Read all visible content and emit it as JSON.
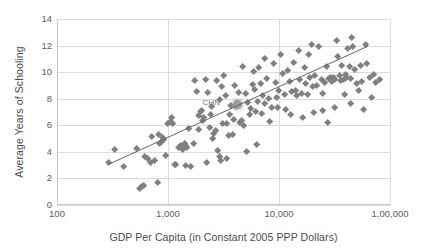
{
  "chart_data": {
    "type": "scatter",
    "title": "",
    "xlabel": "GDP Per Capita (in Constant 2005 PPP Dollars)",
    "ylabel": "Average Years of Schooling",
    "xscale": "log",
    "yscale": "linear",
    "xlim": [
      100,
      100000
    ],
    "ylim": [
      0,
      14
    ],
    "grid": true,
    "legend": null,
    "xticks": [
      {
        "value": 100,
        "label": "100"
      },
      {
        "value": 1000,
        "label": "1,000"
      },
      {
        "value": 10000,
        "label": "10,000"
      },
      {
        "value": 100000,
        "label": "1,00,000"
      }
    ],
    "yticks": [
      {
        "value": 0,
        "label": "0"
      },
      {
        "value": 2,
        "label": "2"
      },
      {
        "value": 4,
        "label": "4"
      },
      {
        "value": 6,
        "label": "6"
      },
      {
        "value": 8,
        "label": "8"
      },
      {
        "value": 10,
        "label": "10"
      },
      {
        "value": 12,
        "label": "12"
      },
      {
        "value": 14,
        "label": "14"
      }
    ],
    "annotations": [
      {
        "text": "CHN",
        "x": 3500,
        "y": 7.6,
        "label_dx": -26,
        "label_dy": -1
      }
    ],
    "highlighted_points": [
      {
        "label": "CHN",
        "x": 4200,
        "y": 7.6
      }
    ],
    "trendline": {
      "type": "linear-on-log",
      "x_start": 290,
      "y_start": 3.05,
      "x_end": 63000,
      "y_end": 11.95,
      "color": "#666666"
    },
    "marker": {
      "shape": "diamond",
      "color": "#808080",
      "highlight_color": "#9a9a9a",
      "size_px": 5.4
    },
    "points": [
      [
        290,
        3.2
      ],
      [
        330,
        4.2
      ],
      [
        400,
        2.85
      ],
      [
        520,
        4.25
      ],
      [
        560,
        1.25
      ],
      [
        580,
        1.35
      ],
      [
        600,
        1.45
      ],
      [
        620,
        3.6
      ],
      [
        660,
        3.45
      ],
      [
        700,
        3.15
      ],
      [
        720,
        5.15
      ],
      [
        760,
        3.35
      ],
      [
        800,
        1.7
      ],
      [
        830,
        5.3
      ],
      [
        850,
        4.6
      ],
      [
        870,
        4.75
      ],
      [
        900,
        5.05
      ],
      [
        920,
        4.9
      ],
      [
        960,
        3.7
      ],
      [
        1000,
        6.1
      ],
      [
        1050,
        6.25
      ],
      [
        1080,
        6.6
      ],
      [
        1100,
        6.1
      ],
      [
        1150,
        3.05
      ],
      [
        1180,
        3.05
      ],
      [
        1250,
        4.3
      ],
      [
        1300,
        4.45
      ],
      [
        1350,
        4.2
      ],
      [
        1400,
        4.6
      ],
      [
        1450,
        4.5
      ],
      [
        1480,
        4.35
      ],
      [
        1550,
        5.75
      ],
      [
        1600,
        2.9
      ],
      [
        1700,
        4.6
      ],
      [
        1750,
        9.35
      ],
      [
        1800,
        8.5
      ],
      [
        1900,
        5.7
      ],
      [
        1950,
        7.05
      ],
      [
        2000,
        7.1
      ],
      [
        2050,
        6.35
      ],
      [
        2100,
        6.6
      ],
      [
        2200,
        9.4
      ],
      [
        2300,
        8.45
      ],
      [
        2400,
        6.8
      ],
      [
        2500,
        7.4
      ],
      [
        2550,
        5.0
      ],
      [
        2600,
        5.4
      ],
      [
        2700,
        5.6
      ],
      [
        2800,
        4.1
      ],
      [
        2900,
        3.6
      ],
      [
        3000,
        3.3
      ],
      [
        3100,
        6.1
      ],
      [
        3200,
        9.7
      ],
      [
        3300,
        8.2
      ],
      [
        3400,
        6.1
      ],
      [
        3500,
        5.2
      ],
      [
        3600,
        6.8
      ],
      [
        3700,
        7.5
      ],
      [
        3800,
        5.3
      ],
      [
        3900,
        6.4
      ],
      [
        4000,
        9.0
      ],
      [
        4100,
        7.4
      ],
      [
        4200,
        7.6
      ],
      [
        4400,
        6.2
      ],
      [
        4600,
        6.35
      ],
      [
        4800,
        5.95
      ],
      [
        5000,
        8.4
      ],
      [
        5200,
        7.7
      ],
      [
        5400,
        6.8
      ],
      [
        5600,
        7.25
      ],
      [
        5800,
        9.05
      ],
      [
        6000,
        8.7
      ],
      [
        6200,
        7.0
      ],
      [
        6400,
        7.75
      ],
      [
        6600,
        10.3
      ],
      [
        6800,
        9.1
      ],
      [
        7000,
        6.9
      ],
      [
        7200,
        8.2
      ],
      [
        7500,
        7.6
      ],
      [
        7800,
        9.5
      ],
      [
        8000,
        8.0
      ],
      [
        8300,
        6.3
      ],
      [
        8600,
        7.3
      ],
      [
        9000,
        10.6
      ],
      [
        9300,
        9.2
      ],
      [
        9600,
        8.1
      ],
      [
        10000,
        8.6
      ],
      [
        10400,
        11.3
      ],
      [
        10800,
        9.9
      ],
      [
        11200,
        8.3
      ],
      [
        11600,
        7.2
      ],
      [
        12000,
        10.1
      ],
      [
        12500,
        9.3
      ],
      [
        13000,
        8.5
      ],
      [
        13500,
        10.7
      ],
      [
        14000,
        8.6
      ],
      [
        14500,
        8.2
      ],
      [
        15000,
        11.6
      ],
      [
        15500,
        9.4
      ],
      [
        16000,
        8.35
      ],
      [
        16500,
        6.6
      ],
      [
        17000,
        10.3
      ],
      [
        17500,
        9.1
      ],
      [
        18000,
        8.3
      ],
      [
        18500,
        11.3
      ],
      [
        19000,
        9.6
      ],
      [
        20000,
        8.9
      ],
      [
        21000,
        9.75
      ],
      [
        22000,
        9.0
      ],
      [
        23000,
        11.9
      ],
      [
        24000,
        9.4
      ],
      [
        25000,
        8.4
      ],
      [
        26000,
        9.2
      ],
      [
        27000,
        10.4
      ],
      [
        28000,
        9.5
      ],
      [
        29000,
        9.6
      ],
      [
        30000,
        9.3
      ],
      [
        31000,
        9.55
      ],
      [
        32000,
        9.45
      ],
      [
        33000,
        12.4
      ],
      [
        34000,
        11.2
      ],
      [
        35000,
        9.7
      ],
      [
        36000,
        9.35
      ],
      [
        37000,
        10.5
      ],
      [
        38000,
        9.4
      ],
      [
        39000,
        8.3
      ],
      [
        40000,
        9.8
      ],
      [
        41000,
        9.6
      ],
      [
        42000,
        11.8
      ],
      [
        43000,
        10.4
      ],
      [
        44000,
        9.5
      ],
      [
        45000,
        12.6
      ],
      [
        46000,
        11.9
      ],
      [
        48000,
        10.2
      ],
      [
        50000,
        9.1
      ],
      [
        52000,
        8.6
      ],
      [
        54000,
        10.5
      ],
      [
        56000,
        9.3
      ],
      [
        58000,
        7.2
      ],
      [
        60000,
        12.1
      ],
      [
        62000,
        10.6
      ],
      [
        65000,
        9.6
      ],
      [
        68000,
        8.1
      ],
      [
        71000,
        9.8
      ],
      [
        75000,
        9.2
      ],
      [
        80000,
        9.45
      ],
      [
        2750,
        9.35
      ],
      [
        3050,
        8.9
      ],
      [
        1900,
        6.7
      ],
      [
        2350,
        5.85
      ],
      [
        5900,
        10.0
      ],
      [
        7400,
        11.0
      ],
      [
        4700,
        10.4
      ],
      [
        12800,
        6.8
      ],
      [
        20500,
        6.95
      ],
      [
        24500,
        7.1
      ],
      [
        31500,
        7.3
      ],
      [
        44000,
        7.6
      ],
      [
        27500,
        6.2
      ],
      [
        19500,
        12.1
      ],
      [
        2250,
        3.15
      ],
      [
        1450,
        2.95
      ],
      [
        3400,
        3.45
      ],
      [
        5100,
        4.0
      ],
      [
        6300,
        4.55
      ],
      [
        2900,
        7.9
      ],
      [
        4300,
        8.45
      ],
      [
        9700,
        7.3
      ]
    ]
  }
}
